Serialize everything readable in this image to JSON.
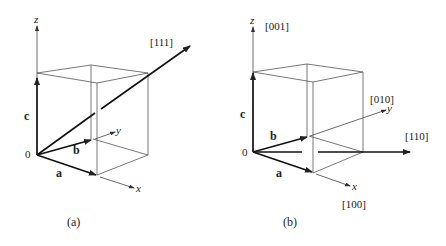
{
  "figure": {
    "panels": [
      {
        "id": "a",
        "caption": "(a)",
        "axes": {
          "x": "x",
          "y": "y",
          "z": "z"
        },
        "vectors": {
          "a": "a",
          "b": "b",
          "c": "c"
        },
        "origin": "0",
        "directions": [
          "[111]"
        ]
      },
      {
        "id": "b",
        "caption": "(b)",
        "axes": {
          "x": "x",
          "y": "y",
          "z": "z"
        },
        "vectors": {
          "a": "a",
          "b": "b",
          "c": "c"
        },
        "origin": "0",
        "directions": [
          "[001]",
          "[010]",
          "[110]",
          "[100]"
        ]
      }
    ]
  }
}
